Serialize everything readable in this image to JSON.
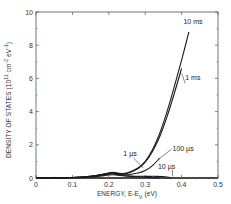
{
  "chart_data": {
    "type": "line",
    "title": "",
    "xlabel": "ENERGY, E-E",
    "xlabel_sub": "V",
    "xlabel_suffix": " (eV)",
    "ylabel": "DENSITY OF STATES (10",
    "ylabel_sup1": "11",
    "ylabel_mid": " cm",
    "ylabel_sup2": "-2",
    "ylabel_mid2": " eV",
    "ylabel_sup3": "-1",
    "ylabel_end": ")",
    "xlim": [
      0,
      0.5
    ],
    "ylim": [
      0,
      10
    ],
    "xticks": [
      0,
      0.1,
      0.2,
      0.3,
      0.4,
      0.5
    ],
    "xtick_labels": [
      "0",
      "0.1",
      "0.2",
      "0.3",
      "0.4",
      "0.5"
    ],
    "yticks": [
      0,
      2,
      4,
      6,
      8,
      10
    ],
    "ytick_labels": [
      "0",
      "2",
      "4",
      "6",
      "8",
      "10"
    ],
    "grid": false,
    "legend": "inline labels",
    "series": [
      {
        "name": "10 ms",
        "label": "10 ms",
        "x": [
          0.0,
          0.1,
          0.15,
          0.19,
          0.21,
          0.23,
          0.25,
          0.28,
          0.3,
          0.32,
          0.34,
          0.36,
          0.38,
          0.4,
          0.42
        ],
        "y": [
          0.0,
          0.03,
          0.1,
          0.25,
          0.35,
          0.28,
          0.3,
          0.6,
          1.0,
          1.7,
          2.7,
          4.0,
          5.5,
          7.1,
          8.8
        ]
      },
      {
        "name": "1 ms",
        "label": "1 ms",
        "x": [
          0.0,
          0.1,
          0.15,
          0.19,
          0.21,
          0.23,
          0.25,
          0.28,
          0.3,
          0.32,
          0.34,
          0.36,
          0.38,
          0.4
        ],
        "y": [
          0.0,
          0.03,
          0.1,
          0.25,
          0.33,
          0.26,
          0.28,
          0.55,
          0.95,
          1.6,
          2.5,
          3.7,
          5.1,
          6.6
        ]
      },
      {
        "name": "100 us",
        "label": "100 µs",
        "x": [
          0.0,
          0.1,
          0.15,
          0.19,
          0.21,
          0.23,
          0.25,
          0.28,
          0.3,
          0.32,
          0.34
        ],
        "y": [
          0.0,
          0.03,
          0.1,
          0.22,
          0.3,
          0.22,
          0.2,
          0.3,
          0.45,
          0.75,
          1.2
        ]
      },
      {
        "name": "10 us",
        "label": "10 µs",
        "x": [
          0.0,
          0.1,
          0.15,
          0.19,
          0.21,
          0.23,
          0.26,
          0.3,
          0.33,
          0.36,
          0.37
        ],
        "y": [
          0.0,
          0.02,
          0.08,
          0.2,
          0.25,
          0.18,
          0.12,
          0.1,
          0.1,
          0.06,
          0.0
        ]
      },
      {
        "name": "1 us",
        "label": "1 µs",
        "x": [
          0.0,
          0.1,
          0.15,
          0.19,
          0.21,
          0.23,
          0.26,
          0.3,
          0.32,
          0.34
        ],
        "y": [
          0.0,
          0.02,
          0.06,
          0.15,
          0.2,
          0.15,
          0.1,
          0.06,
          0.03,
          0.0
        ]
      }
    ],
    "annotations": [
      {
        "text": "10 ms",
        "x": 0.405,
        "y": 9.3
      },
      {
        "text": "1 ms",
        "x": 0.41,
        "y": 5.9
      },
      {
        "text": "100 µs",
        "x": 0.375,
        "y": 1.6
      },
      {
        "text": "10 µs",
        "x": 0.335,
        "y": 0.55
      },
      {
        "text": "1 µs",
        "x": 0.24,
        "y": 1.35
      }
    ]
  },
  "plot": {
    "x0": 36,
    "x1": 218,
    "y0": 178,
    "y1": 12,
    "line_color": "#1a1a1a",
    "axis_color": "#555555"
  }
}
